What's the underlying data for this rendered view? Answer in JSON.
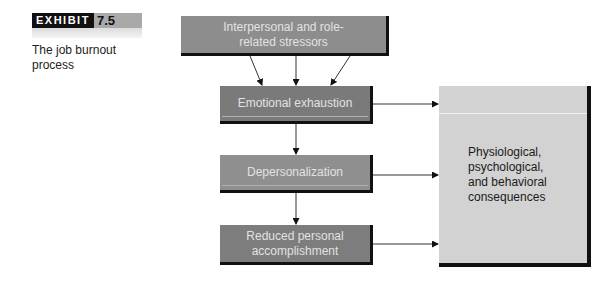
{
  "exhibit": {
    "label": "EXHIBIT",
    "number": "7.5"
  },
  "caption": "The job burnout process",
  "nodes": {
    "stressors": "Interpersonal and role-related stressors",
    "emotional": "Emotional exhaustion",
    "depersonalization": "Depersonalization",
    "reduced": "Reduced personal accomplishment",
    "consequences": "Physiological, psychological, and behavioral consequences"
  },
  "colors": {
    "dark_box": "#7a7a7a",
    "mid_box": "#8f8f8f",
    "light_box": "#d2d2d2",
    "shadow": "#111111"
  }
}
